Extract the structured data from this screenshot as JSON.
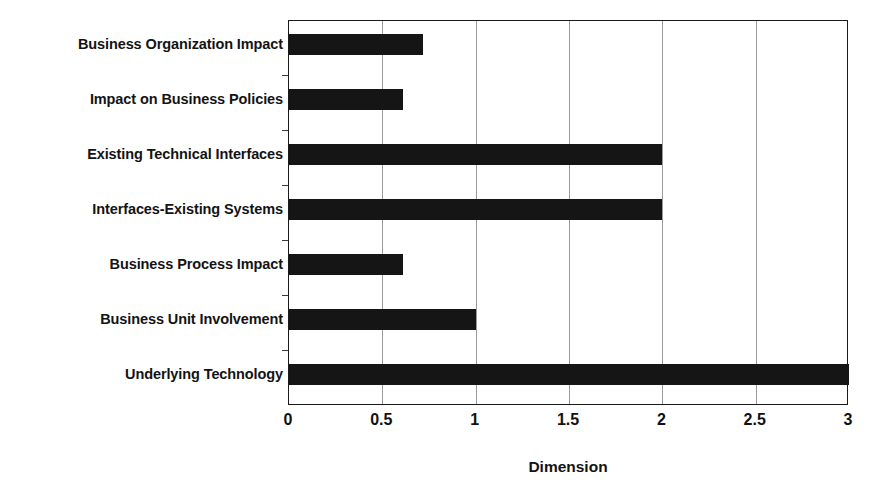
{
  "chart_data": {
    "type": "bar",
    "orientation": "horizontal",
    "title": "",
    "xlabel": "Dimension",
    "ylabel": "",
    "xlim": [
      0,
      3
    ],
    "xticks": [
      "0",
      "0.5",
      "1",
      "1.5",
      "2",
      "2.5",
      "3"
    ],
    "xtick_values": [
      0,
      0.5,
      1,
      1.5,
      2,
      2.5,
      3
    ],
    "grid": "vertical",
    "legend": "none",
    "bar_color": "#151515",
    "categories": [
      "Business Organization Impact",
      "Impact on Business Policies",
      "Existing Technical Interfaces",
      "Interfaces-Existing Systems",
      "Business Process Impact",
      "Business Unit Involvement",
      "Underlying Technology"
    ],
    "values": [
      0.72,
      0.61,
      2.0,
      2.0,
      0.61,
      1.0,
      3.0
    ],
    "series": [
      {
        "name": "Dimension",
        "values": [
          0.72,
          0.61,
          2.0,
          2.0,
          0.61,
          1.0,
          3.0
        ]
      }
    ]
  },
  "colors": {
    "bar": "#151515",
    "frame": "#1a1a1a",
    "gridline": "#9a9a9a",
    "background": "#ffffff",
    "text": "#131313"
  }
}
